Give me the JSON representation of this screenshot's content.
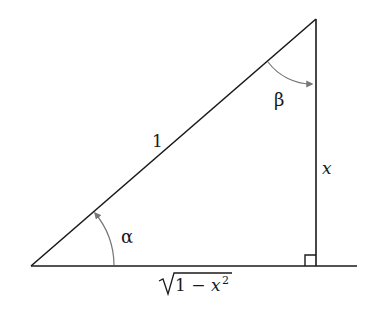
{
  "diagram": {
    "type": "right-triangle",
    "colors": {
      "line": "#1a1a1a",
      "arc": "#777777",
      "background": "#ffffff"
    },
    "vertices": {
      "bottom_left": [
        31,
        266
      ],
      "right_angle": [
        316,
        266
      ],
      "top": [
        316,
        19
      ]
    },
    "baseline_end": [
      357,
      266
    ],
    "labels": {
      "hypotenuse": "1",
      "vertical_side": "x",
      "base_radical": "1 − x",
      "base_exponent": "2",
      "angle_alpha": "α",
      "angle_beta": "β"
    },
    "right_angle_marker_size": 11
  }
}
